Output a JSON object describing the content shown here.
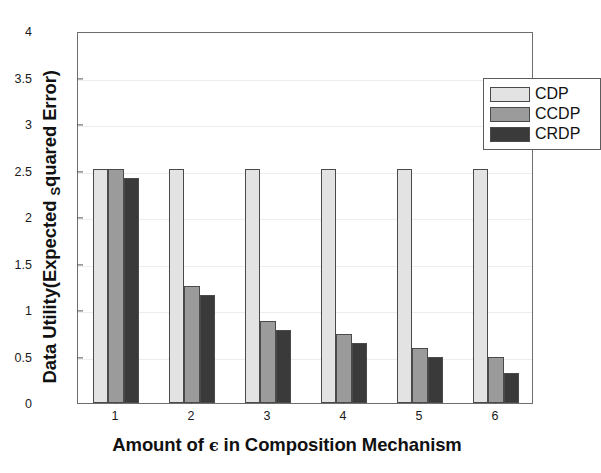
{
  "chart_data": {
    "type": "bar",
    "title": "",
    "xlabel": "Amount of ϵ in Composition Mechanism",
    "ylabel": "Data Utility(Expected Squared Error)",
    "ylabel_main_before": "Data Utility(Expected ",
    "ylabel_sub": "S",
    "ylabel_main_after": "quared Error)",
    "xlabel_before": "Amount of ",
    "xlabel_symbol": "ϵ",
    "xlabel_after": " in Composition Mechanism",
    "categories": [
      "1",
      "2",
      "3",
      "4",
      "5",
      "6"
    ],
    "series": [
      {
        "name": "CDP",
        "color": "#e3e3e3",
        "values": [
          2.52,
          2.52,
          2.52,
          2.52,
          2.52,
          2.52
        ]
      },
      {
        "name": "CCDP",
        "color": "#9b9b9b",
        "values": [
          2.52,
          1.26,
          0.88,
          0.74,
          0.59,
          0.5
        ]
      },
      {
        "name": "CRDP",
        "color": "#3a3a3a",
        "values": [
          2.42,
          1.16,
          0.78,
          0.64,
          0.49,
          0.32
        ]
      }
    ],
    "ylim": [
      0,
      4
    ],
    "yticks": [
      "0",
      "0.5",
      "1",
      "1.5",
      "2",
      "2.5",
      "3",
      "3.5",
      "4"
    ],
    "ytick_values": [
      0,
      0.5,
      1,
      1.5,
      2,
      2.5,
      3,
      3.5,
      4
    ],
    "grid": true,
    "legend_position": "top-right",
    "legend": [
      "CDP",
      "CCDP",
      "CRDP"
    ],
    "axis_color": "#6e6e6e",
    "grid_color": "#ededed",
    "background": "#ffffff"
  }
}
